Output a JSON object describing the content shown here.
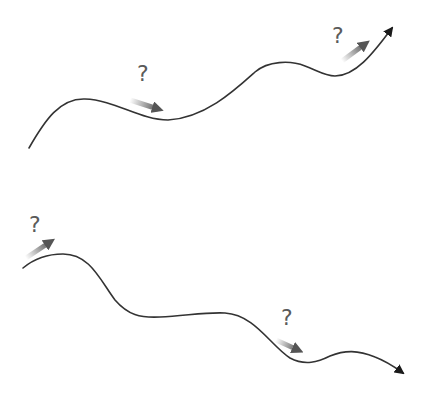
{
  "diagram": {
    "colors": {
      "path": "#333333",
      "arrow_head": "#1a1a1a",
      "motion_arrow": "#555555",
      "question_mark": "#5a5a5a",
      "background": "#ffffff"
    },
    "paths": [
      {
        "id": "upward-path",
        "direction": "up-right",
        "d": "M29,148 C45,120 60,98 85,99 C115,100 140,120 168,120 C205,118 235,90 255,72 C268,61 290,60 305,66 C318,71 325,76 335,76 C355,76 372,55 392,28",
        "markers": [
          {
            "label": "?",
            "x": 137,
            "y": 63,
            "arrow": {
              "x1": 130,
              "y1": 100,
              "x2": 158,
              "y2": 109
            }
          },
          {
            "label": "?",
            "x": 332,
            "y": 25,
            "arrow": {
              "x1": 342,
              "y1": 61,
              "x2": 365,
              "y2": 44
            }
          }
        ]
      },
      {
        "id": "downward-path",
        "direction": "down-right",
        "d": "M23,268 C35,258 48,254 63,254 C90,254 100,280 115,300 C128,315 140,318 160,317 C185,316 205,312 225,313 C255,315 270,345 290,358 C305,366 318,362 330,356 C345,350 358,350 375,357 C388,362 396,368 403,373",
        "markers": [
          {
            "label": "?",
            "x": 29,
            "y": 214,
            "arrow": {
              "x1": 26,
              "y1": 258,
              "x2": 50,
              "y2": 242
            }
          },
          {
            "label": "?",
            "x": 281,
            "y": 307,
            "arrow": {
              "x1": 276,
              "y1": 340,
              "x2": 298,
              "y2": 350
            }
          }
        ]
      }
    ]
  }
}
